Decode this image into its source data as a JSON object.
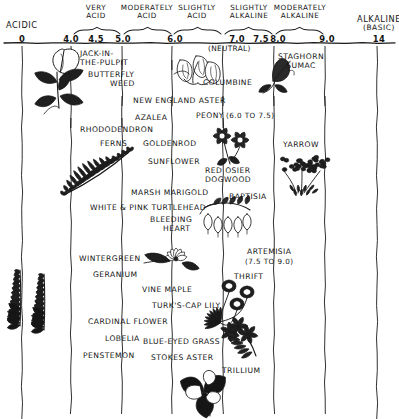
{
  "axis": {
    "left_end_label": "ACIDIC",
    "right_end_label": "ALKALINE",
    "right_end_sub": "(BASIC)",
    "neutral_label": "(NEUTRAL)",
    "ticks": [
      {
        "value": "0",
        "x": 22
      },
      {
        "value": "4.0",
        "x": 71
      },
      {
        "value": "4.5",
        "x": 96
      },
      {
        "value": "5.0",
        "x": 123
      },
      {
        "value": "6.0",
        "x": 175
      },
      {
        "value": "7.0",
        "x": 237
      },
      {
        "value": "7.5",
        "x": 261
      },
      {
        "value": "8.0",
        "x": 278
      },
      {
        "value": "9.0",
        "x": 327
      },
      {
        "value": "14",
        "x": 379
      }
    ],
    "gridlines_x": [
      22,
      71,
      122,
      172,
      223,
      274,
      325,
      377
    ],
    "categories": [
      {
        "line1": "VERY",
        "line2": "ACID",
        "x": 96,
        "brace_x1": 74,
        "brace_x2": 120
      },
      {
        "line1": "MODERATELY",
        "line2": "ACID",
        "x": 147,
        "brace_x1": 124,
        "brace_x2": 171
      },
      {
        "line1": "SLIGHTLY",
        "line2": "ACID",
        "x": 197,
        "brace_x1": 174,
        "brace_x2": 221
      },
      {
        "line1": "SLIGHTLY",
        "line2": "ALKALINE",
        "x": 249,
        "brace_x1": 225,
        "brace_x2": 272
      },
      {
        "line1": "MODERATELY",
        "line2": "ALKALINE",
        "x": 300,
        "brace_x1": 276,
        "brace_x2": 323
      }
    ]
  },
  "plants": [
    {
      "name": "JACK-IN-\nTHE-PULPIT",
      "x": 80,
      "y": 50,
      "align": "left"
    },
    {
      "name": "BUTTERFLY\nWEED",
      "x": 88,
      "y": 71,
      "align": "left"
    },
    {
      "name": "STAGHORN\nSUMAC",
      "x": 278,
      "y": 53,
      "align": "center"
    },
    {
      "name": "COLUMBINE",
      "x": 203,
      "y": 79,
      "align": "left"
    },
    {
      "name": "NEW ENGLAND ASTER",
      "x": 133,
      "y": 97,
      "align": "left"
    },
    {
      "name": "PEONY",
      "x": 196,
      "y": 112,
      "align": "left"
    },
    {
      "name": "(6.0 TO 7.5)",
      "x": 226,
      "y": 112,
      "align": "left"
    },
    {
      "name": "AZALEA",
      "x": 135,
      "y": 114,
      "align": "left"
    },
    {
      "name": "RHODODENDRON",
      "x": 80,
      "y": 126,
      "align": "left"
    },
    {
      "name": "FERNS",
      "x": 100,
      "y": 140,
      "align": "left"
    },
    {
      "name": "GOLDENROD",
      "x": 143,
      "y": 140,
      "align": "left"
    },
    {
      "name": "SUNFLOWER",
      "x": 148,
      "y": 158,
      "align": "left"
    },
    {
      "name": "YARROW",
      "x": 283,
      "y": 141,
      "align": "left"
    },
    {
      "name": "RED OSIER\nDOGWOOD",
      "x": 205,
      "y": 167,
      "align": "left"
    },
    {
      "name": "MARSH MARIGOLD",
      "x": 131,
      "y": 189,
      "align": "left"
    },
    {
      "name": "BAPTISIA",
      "x": 229,
      "y": 193,
      "align": "left"
    },
    {
      "name": "WHITE & PINK  TURTLEHEAD",
      "x": 90,
      "y": 204,
      "align": "left"
    },
    {
      "name": "BLEEDING\nHEART",
      "x": 150,
      "y": 216,
      "align": "left"
    },
    {
      "name": "WINTERGREEN",
      "x": 79,
      "y": 255,
      "align": "left"
    },
    {
      "name": "ARTEMISIA",
      "x": 247,
      "y": 248,
      "align": "left"
    },
    {
      "name": "(7.5 TO 9.0)",
      "x": 245,
      "y": 258,
      "align": "left"
    },
    {
      "name": "GERANIUM",
      "x": 93,
      "y": 271,
      "align": "left"
    },
    {
      "name": "VINE MAPLE",
      "x": 142,
      "y": 286,
      "align": "left"
    },
    {
      "name": "THRIFT",
      "x": 234,
      "y": 273,
      "align": "left"
    },
    {
      "name": "TURK'S-CAP LILY",
      "x": 152,
      "y": 302,
      "align": "left"
    },
    {
      "name": "CARDINAL FLOWER",
      "x": 88,
      "y": 318,
      "align": "left"
    },
    {
      "name": "LOBELIA",
      "x": 105,
      "y": 335,
      "align": "left"
    },
    {
      "name": "BLUE-EYED GRASS",
      "x": 143,
      "y": 338,
      "align": "left"
    },
    {
      "name": "PENSTEMON",
      "x": 83,
      "y": 352,
      "align": "left"
    },
    {
      "name": "STOKES ASTER",
      "x": 151,
      "y": 354,
      "align": "left"
    },
    {
      "name": "TRILLIUM",
      "x": 222,
      "y": 367,
      "align": "left"
    }
  ],
  "illustrations": [
    {
      "id": "jack-in-the-pulpit-drawing",
      "x": 30,
      "y": 44,
      "w": 58,
      "h": 75
    },
    {
      "id": "columbine-drawing",
      "x": 172,
      "y": 52,
      "w": 42,
      "h": 36
    },
    {
      "id": "staghorn-sumac-drawing",
      "x": 255,
      "y": 55,
      "w": 40,
      "h": 28
    },
    {
      "id": "fern-drawing",
      "x": 62,
      "y": 145,
      "w": 72,
      "h": 52
    },
    {
      "id": "red-osier-dogwood-drawing",
      "x": 212,
      "y": 124,
      "w": 46,
      "h": 42
    },
    {
      "id": "yarrow-drawing",
      "x": 276,
      "y": 155,
      "w": 58,
      "h": 40
    },
    {
      "id": "bleeding-heart-drawing",
      "x": 198,
      "y": 196,
      "w": 56,
      "h": 44
    },
    {
      "id": "vine-maple-drawing",
      "x": 136,
      "y": 247,
      "w": 60,
      "h": 28
    },
    {
      "id": "cardinal-flower-drawing",
      "x": 0,
      "y": 268,
      "w": 62,
      "h": 62
    },
    {
      "id": "thrift-drawing",
      "x": 207,
      "y": 278,
      "w": 62,
      "h": 58
    },
    {
      "id": "turks-cap-lily-drawing",
      "x": 212,
      "y": 318,
      "w": 58,
      "h": 42
    },
    {
      "id": "trillium-drawing",
      "x": 170,
      "y": 372,
      "w": 68,
      "h": 40
    }
  ],
  "colors": {
    "ink": "#1a1a1a",
    "paper": "#ffffff"
  }
}
